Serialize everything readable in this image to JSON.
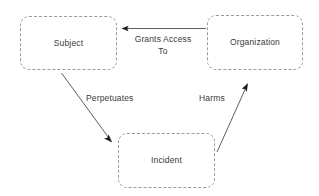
{
  "diagram": {
    "background_color": "#ffffff",
    "node_border_color": "#9a9a9a",
    "text_color": "#3a3a3a",
    "arrow_color": "#4c4c4c",
    "nodes": [
      {
        "id": "subject",
        "label": "Subject"
      },
      {
        "id": "organization",
        "label": "Organization"
      },
      {
        "id": "incident",
        "label": "Incident"
      }
    ],
    "edges": [
      {
        "id": "grants-access-to",
        "from": "organization",
        "to": "subject",
        "label_line1": "Grants Access",
        "label_line2": "To"
      },
      {
        "id": "perpetuates",
        "from": "subject",
        "to": "incident",
        "label": "Perpetuates"
      },
      {
        "id": "harms",
        "from": "incident",
        "to": "organization",
        "label": "Harms"
      }
    ]
  }
}
